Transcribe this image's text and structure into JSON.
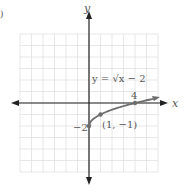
{
  "chart_data": {
    "type": "line",
    "title": "",
    "function_label": "y = √x − 2",
    "xlabel": "x",
    "ylabel": "y",
    "xlim": [
      -6,
      6
    ],
    "ylim": [
      -6,
      6
    ],
    "grid": true,
    "curve": {
      "name": "y = sqrt(x) - 2",
      "x": [
        0,
        0.25,
        1,
        2,
        3,
        4,
        5,
        5.9
      ],
      "y": [
        -2,
        -1.5,
        -1,
        -0.586,
        -0.268,
        0,
        0.236,
        0.429
      ]
    },
    "points": [
      {
        "x": 0,
        "y": -2,
        "label": "−2"
      },
      {
        "x": 1,
        "y": -1,
        "label": "(1, −1)"
      },
      {
        "x": 4,
        "y": 0,
        "label": "4"
      }
    ],
    "colors": {
      "curve": "#6e6e6e",
      "axis": "#222222",
      "grid": "#dcdcdc"
    }
  },
  "corner_mark": ")"
}
